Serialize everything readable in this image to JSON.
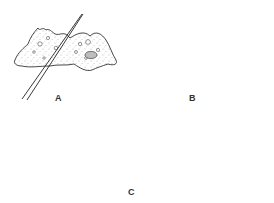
{
  "figure": {
    "colors": {
      "outline": "#333333",
      "cytoplasm": "#ffffff",
      "stipple": "#777777",
      "nucleus_fill": "#bdbdbd",
      "needle": "#222222",
      "background": "#ffffff"
    },
    "panels": [
      {
        "id": "A",
        "label": "A",
        "content": "glass needle slicing through an amoeba"
      },
      {
        "id": "B",
        "label": "B",
        "content": "amoeba cut into two fragments: anucleate (left) and nucleated (right)"
      },
      {
        "id": "C",
        "label": "C",
        "content": "anucleate fragment rounded up; nucleated fragment remains amoeboid"
      }
    ]
  }
}
